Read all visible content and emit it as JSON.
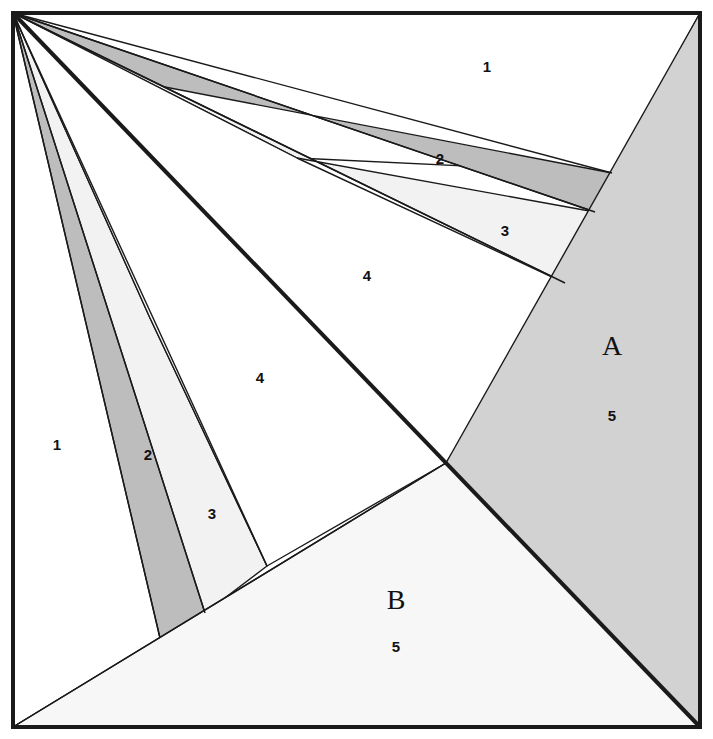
{
  "figure": {
    "canvas": {
      "width": 713,
      "height": 739
    },
    "colors": {
      "background": "#ffffff",
      "stroke": "#1a1a1a",
      "fill_white": "#ffffff",
      "fill_light": "#f2f2f2",
      "fill_medium": "#d0d0d0",
      "fill_dark": "#bdbdbd",
      "fill_region_a": "#d2d2d2",
      "fill_region_b": "#f7f7f7",
      "label_color": "#111111"
    },
    "border": {
      "x": 13,
      "y": 13,
      "width": 687,
      "height": 714,
      "stroke_width": 4
    },
    "apex": {
      "x": 13,
      "y": 13
    },
    "junction": {
      "x": 446,
      "y": 463
    },
    "corners": {
      "top_left": {
        "x": 13,
        "y": 13
      },
      "top_right": {
        "x": 700,
        "y": 13
      },
      "bottom_right": {
        "x": 700,
        "y": 727
      },
      "bottom_left": {
        "x": 13,
        "y": 727
      }
    },
    "main_diagonal": {
      "name": "bold-diagonal",
      "from": {
        "x": 13,
        "y": 13
      },
      "to": {
        "x": 700,
        "y": 727
      },
      "stroke_width": 4
    },
    "lower_diagonal": {
      "name": "lower-left-diagonal",
      "from": {
        "x": 13,
        "y": 727
      },
      "to": {
        "x": 446,
        "y": 463
      },
      "stroke_width": 1.4
    },
    "regions": [
      {
        "id": "upper-1",
        "label": "1",
        "shade": "white",
        "label_pos": {
          "x": 487,
          "y": 68
        },
        "points": "13,13 700,13 612,173 297,158 144,83"
      },
      {
        "id": "upper-2",
        "label": "2",
        "shade": "dark",
        "label_pos": {
          "x": 440,
          "y": 160
        },
        "points": "13,13 144,83 612,173 595,212"
      },
      {
        "id": "upper-3",
        "label": "3",
        "shade": "light",
        "label_pos": {
          "x": 505,
          "y": 232
        },
        "points": "13,13 297,158 595,212 565,283"
      },
      {
        "id": "upper-4",
        "label": "4",
        "shade": "white",
        "label_pos": {
          "x": 367,
          "y": 277
        },
        "points": "13,13 297,158 565,283 446,463"
      },
      {
        "id": "region-a",
        "label": "A",
        "sub_label": "5",
        "shade": "region_a",
        "label_pos": {
          "x": 612,
          "y": 349
        },
        "sub_label_pos": {
          "x": 612,
          "y": 417
        },
        "points": "700,13 700,727 446,463"
      },
      {
        "id": "lower-1",
        "label": "1",
        "shade": "white",
        "label_pos": {
          "x": 57,
          "y": 446
        },
        "points": "13,13 74,152 160,638 13,727"
      },
      {
        "id": "lower-2",
        "label": "2",
        "shade": "dark",
        "label_pos": {
          "x": 148,
          "y": 456
        },
        "points": "13,13 74,152 205,613 160,638"
      },
      {
        "id": "lower-3",
        "label": "3",
        "shade": "light",
        "label_pos": {
          "x": 212,
          "y": 515
        },
        "points": "13,13 150,318 267,566 205,613"
      },
      {
        "id": "lower-4",
        "label": "4",
        "shade": "white",
        "label_pos": {
          "x": 260,
          "y": 379
        },
        "points": "13,13 150,318 267,566 446,463"
      },
      {
        "id": "region-b",
        "label": "B",
        "sub_label": "5",
        "shade": "region_b",
        "label_pos": {
          "x": 396,
          "y": 603
        },
        "sub_label_pos": {
          "x": 396,
          "y": 648
        },
        "points": "13,727 446,463 700,727"
      }
    ],
    "divider_lines": [
      {
        "name": "upper-ray-to-144-83",
        "from": {
          "x": 13,
          "y": 13
        },
        "to": {
          "x": 612,
          "y": 173
        }
      },
      {
        "name": "upper-ray-2-lower",
        "from": {
          "x": 13,
          "y": 13
        },
        "to": {
          "x": 595,
          "y": 212
        }
      },
      {
        "name": "upper-ray-3-lower",
        "from": {
          "x": 13,
          "y": 13
        },
        "to": {
          "x": 565,
          "y": 283
        }
      },
      {
        "name": "lower-ray-1",
        "from": {
          "x": 13,
          "y": 13
        },
        "to": {
          "x": 160,
          "y": 638
        }
      },
      {
        "name": "lower-ray-2",
        "from": {
          "x": 13,
          "y": 13
        },
        "to": {
          "x": 205,
          "y": 613
        }
      },
      {
        "name": "lower-ray-3",
        "from": {
          "x": 13,
          "y": 13
        },
        "to": {
          "x": 267,
          "y": 566
        }
      }
    ]
  },
  "chart_data": {
    "type": "diagram",
    "numbered_strips_upper": [
      "1",
      "2",
      "3",
      "4"
    ],
    "numbered_strips_lower": [
      "1",
      "2",
      "3",
      "4"
    ],
    "named_regions": [
      {
        "name": "A",
        "number": "5"
      },
      {
        "name": "B",
        "number": "5"
      }
    ]
  }
}
